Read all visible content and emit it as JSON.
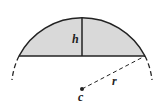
{
  "diagram": {
    "labels": {
      "height": "h",
      "radius": "r",
      "center": "c"
    },
    "colors": {
      "stroke": "#222222",
      "fill": "#d9d9d9"
    }
  }
}
